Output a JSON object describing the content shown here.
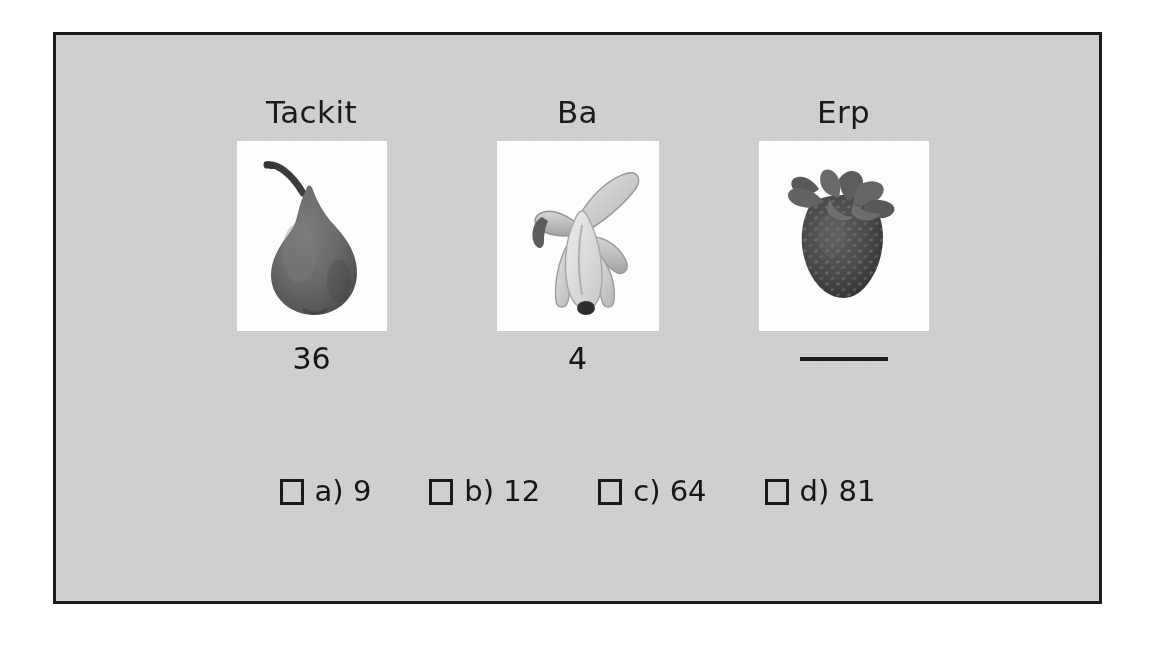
{
  "worksheet": {
    "frame_border_color": "#1c1c1c",
    "panel_color": "#d4d4d4",
    "card_color": "#fdfdfd",
    "text_color": "#161616"
  },
  "items": [
    {
      "label": "Tackit",
      "image": "pear-image",
      "value": "36",
      "has_value": true
    },
    {
      "label": "Ba",
      "image": "banana-image",
      "value": "4",
      "has_value": true
    },
    {
      "label": "Erp",
      "image": "strawberry-image",
      "value": "",
      "has_value": false,
      "blank_answer_line": true
    }
  ],
  "options": [
    {
      "id": "a",
      "text": "a) 9",
      "checked": false
    },
    {
      "id": "b",
      "text": "b) 12",
      "checked": false
    },
    {
      "id": "c",
      "text": "c) 64",
      "checked": false
    },
    {
      "id": "d",
      "text": "d) 81",
      "checked": false
    }
  ]
}
